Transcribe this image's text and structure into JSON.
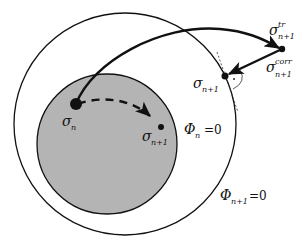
{
  "diagram": {
    "colors": {
      "background": "#ffffff",
      "inner_fill": "#b4b4b4",
      "stroke": "#111111"
    },
    "surfaces": {
      "outer": {
        "label_symbol": "Φ",
        "label_sub": "n+1",
        "label_eq": "=0"
      },
      "inner": {
        "label_symbol": "Φ",
        "label_sub": "n",
        "label_eq": "=0"
      }
    },
    "points": {
      "sigma_n": {
        "symbol": "σ",
        "sub": "n",
        "sup": ""
      },
      "sigma_n1_inner": {
        "symbol": "σ",
        "sub": "n+1",
        "sup": ""
      },
      "sigma_tr": {
        "symbol": "σ",
        "sub": "n+1",
        "sup": "tr"
      },
      "sigma_corr": {
        "symbol": "σ",
        "sub": "n+1",
        "sup": "corr"
      },
      "sigma_n1_outer": {
        "symbol": "σ",
        "sub": "n+1",
        "sup": ""
      }
    },
    "right_angle_marker": "·"
  }
}
